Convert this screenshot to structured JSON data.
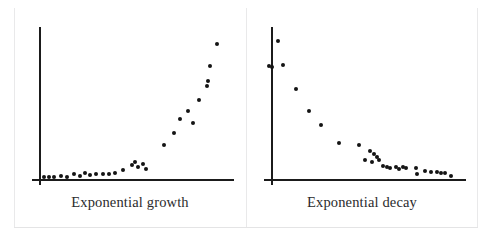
{
  "figure": {
    "background_color": "#ffffff",
    "rule_color": "#e9e9ea",
    "axis_color": "#1b1b1b",
    "marker_color": "#141414"
  },
  "chart_data": [
    {
      "type": "scatter",
      "title": "Exponential growth",
      "xlabel": "",
      "ylabel": "",
      "xlim": [
        0,
        100
      ],
      "ylim": [
        0,
        100
      ],
      "grid": false,
      "legend": "none",
      "axes": {
        "y_axis_x": 7,
        "y_axis_top": 98,
        "x_axis_y": 0,
        "x_axis_right": 100
      },
      "points": [
        {
          "x": 9.5,
          "y": 1.0
        },
        {
          "x": 12.0,
          "y": 1.5
        },
        {
          "x": 14.5,
          "y": 1.2
        },
        {
          "x": 17.5,
          "y": 2.2
        },
        {
          "x": 20.5,
          "y": 1.4
        },
        {
          "x": 24.0,
          "y": 3.4
        },
        {
          "x": 26.5,
          "y": 2.0
        },
        {
          "x": 29.0,
          "y": 4.0
        },
        {
          "x": 31.5,
          "y": 2.6
        },
        {
          "x": 34.5,
          "y": 3.0
        },
        {
          "x": 37.5,
          "y": 3.2
        },
        {
          "x": 40.5,
          "y": 3.0
        },
        {
          "x": 43.5,
          "y": 3.6
        },
        {
          "x": 47.0,
          "y": 5.6
        },
        {
          "x": 51.5,
          "y": 9.2
        },
        {
          "x": 53.0,
          "y": 11.0
        },
        {
          "x": 54.5,
          "y": 8.0
        },
        {
          "x": 56.5,
          "y": 9.6
        },
        {
          "x": 58.0,
          "y": 6.6
        },
        {
          "x": 66.5,
          "y": 22.0
        },
        {
          "x": 71.5,
          "y": 30.0
        },
        {
          "x": 74.5,
          "y": 39.0
        },
        {
          "x": 78.0,
          "y": 44.0
        },
        {
          "x": 80.5,
          "y": 36.0
        },
        {
          "x": 83.5,
          "y": 51.0
        },
        {
          "x": 87.0,
          "y": 60.0
        },
        {
          "x": 87.5,
          "y": 63.5
        },
        {
          "x": 88.5,
          "y": 73.0
        },
        {
          "x": 92.0,
          "y": 87.0
        }
      ]
    },
    {
      "type": "scatter",
      "title": "Exponential decay",
      "xlabel": "",
      "ylabel": "",
      "xlim": [
        0,
        100
      ],
      "ylim": [
        0,
        100
      ],
      "grid": false,
      "legend": "none",
      "axes": {
        "y_axis_x": 7,
        "y_axis_top": 98,
        "x_axis_y": 0,
        "x_axis_right": 100
      },
      "points": [
        {
          "x": 10.5,
          "y": 89.0
        },
        {
          "x": 6.0,
          "y": 73.0
        },
        {
          "x": 7.5,
          "y": 72.0
        },
        {
          "x": 13.0,
          "y": 73.5
        },
        {
          "x": 19.0,
          "y": 58.0
        },
        {
          "x": 25.0,
          "y": 44.0
        },
        {
          "x": 31.0,
          "y": 35.0
        },
        {
          "x": 39.5,
          "y": 23.0
        },
        {
          "x": 49.0,
          "y": 22.0
        },
        {
          "x": 54.5,
          "y": 18.0
        },
        {
          "x": 56.0,
          "y": 16.0
        },
        {
          "x": 57.5,
          "y": 14.5
        },
        {
          "x": 52.0,
          "y": 12.0
        },
        {
          "x": 55.0,
          "y": 11.0
        },
        {
          "x": 58.5,
          "y": 12.5
        },
        {
          "x": 60.5,
          "y": 8.5
        },
        {
          "x": 62.5,
          "y": 8.0
        },
        {
          "x": 64.0,
          "y": 7.0
        },
        {
          "x": 66.5,
          "y": 7.5
        },
        {
          "x": 68.0,
          "y": 6.5
        },
        {
          "x": 70.0,
          "y": 8.0
        },
        {
          "x": 71.5,
          "y": 6.8
        },
        {
          "x": 76.0,
          "y": 7.0
        },
        {
          "x": 76.5,
          "y": 3.2
        },
        {
          "x": 80.5,
          "y": 5.0
        },
        {
          "x": 83.5,
          "y": 4.6
        },
        {
          "x": 86.0,
          "y": 4.2
        },
        {
          "x": 88.0,
          "y": 4.0
        },
        {
          "x": 90.0,
          "y": 4.0
        },
        {
          "x": 93.0,
          "y": 2.0
        }
      ]
    }
  ]
}
